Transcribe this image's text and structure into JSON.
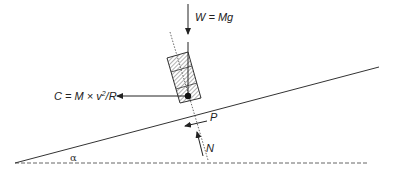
{
  "diagram": {
    "title": "",
    "labels": {
      "weight": "W = Mg",
      "centrifugal_prefix": "C = M × v",
      "centrifugal_sup": "2",
      "centrifugal_suffix": "/R",
      "friction": "P",
      "normal": "N",
      "angle": "α"
    },
    "colors": {
      "line": "#333333",
      "hatch": "#555555",
      "dashed": "#666666"
    },
    "elements": [
      {
        "id": "incline",
        "type": "line",
        "from": [
          15,
          163
        ],
        "to": [
          379,
          67
        ]
      },
      {
        "id": "horizontal",
        "type": "dashed-line",
        "from": [
          15,
          163
        ],
        "to": [
          367,
          163
        ]
      },
      {
        "id": "block",
        "type": "hatched-rectangle",
        "corners": [
          [
            167,
            58
          ],
          [
            188,
            52
          ],
          [
            201,
            98
          ],
          [
            180,
            103
          ]
        ]
      },
      {
        "id": "axis",
        "type": "dotted-line",
        "from": [
          170,
          32
        ],
        "to": [
          208,
          160
        ]
      },
      {
        "id": "weight-arrow",
        "type": "arrow",
        "from": [
          188,
          4
        ],
        "to": [
          188,
          36
        ],
        "label": "weight"
      },
      {
        "id": "centrifugal-arrow",
        "type": "arrow",
        "from": [
          188,
          96
        ],
        "to": [
          114,
          96
        ],
        "label": "centrifugal"
      },
      {
        "id": "friction-arrow",
        "type": "arrow",
        "from": [
          207,
          121
        ],
        "to": [
          183,
          127
        ],
        "label": "friction"
      },
      {
        "id": "normal-arrow",
        "type": "arrow",
        "from": [
          203,
          155
        ],
        "to": [
          197,
          130
        ],
        "label": "normal"
      },
      {
        "id": "center-of-mass",
        "type": "dot",
        "at": [
          188,
          96
        ]
      }
    ]
  }
}
